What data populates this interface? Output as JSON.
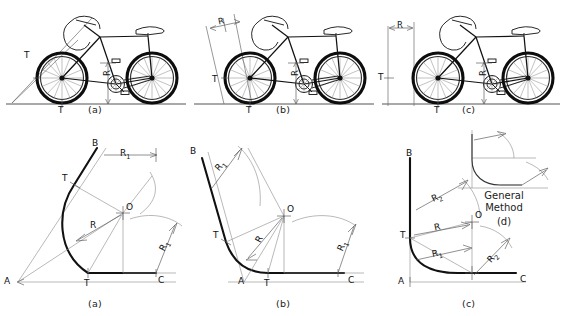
{
  "figure": {
    "background": "#ffffff",
    "ink": "#111111",
    "construction_color": "#8a8a8a"
  },
  "row1": {
    "panels": [
      {
        "caption": "(a)",
        "labels": [
          {
            "text": "T",
            "role": "tangent-point-left"
          },
          {
            "text": "T",
            "role": "tangent-point-ground"
          },
          {
            "text": "R",
            "role": "radius-vertical"
          }
        ]
      },
      {
        "caption": "(b)",
        "labels": [
          {
            "text": "R",
            "role": "radius-angled"
          },
          {
            "text": "T",
            "role": "tangent-point-left"
          },
          {
            "text": "T",
            "role": "tangent-point-ground"
          },
          {
            "text": "R",
            "role": "radius-vertical"
          }
        ]
      },
      {
        "caption": "(c)",
        "labels": [
          {
            "text": "R",
            "role": "radius-horizontal"
          },
          {
            "text": "T",
            "role": "tangent-point-left"
          },
          {
            "text": "T",
            "role": "tangent-point-ground"
          },
          {
            "text": "R",
            "role": "radius-vertical"
          }
        ]
      }
    ]
  },
  "row2": {
    "panels": [
      {
        "caption": "(a)",
        "labels": [
          {
            "text": "B",
            "role": "point-b"
          },
          {
            "text": "A",
            "role": "point-a"
          },
          {
            "text": "C",
            "role": "point-c"
          },
          {
            "text": "O",
            "role": "center-o"
          },
          {
            "text": "T",
            "role": "tangent-upper"
          },
          {
            "text": "T",
            "role": "tangent-lower"
          },
          {
            "text": "R",
            "role": "radius-main"
          },
          {
            "text": "R",
            "sub": "1",
            "role": "radius-one-top"
          },
          {
            "text": "R",
            "sub": "1",
            "role": "radius-one-right"
          }
        ]
      },
      {
        "caption": "(b)",
        "labels": [
          {
            "text": "B",
            "role": "point-b"
          },
          {
            "text": "A",
            "role": "point-a"
          },
          {
            "text": "C",
            "role": "point-c"
          },
          {
            "text": "O",
            "role": "center-o"
          },
          {
            "text": "T",
            "role": "tangent-upper"
          },
          {
            "text": "T",
            "role": "tangent-lower"
          },
          {
            "text": "R",
            "role": "radius-main"
          },
          {
            "text": "R",
            "sub": "1",
            "role": "radius-one-top"
          },
          {
            "text": "R",
            "sub": "1",
            "role": "radius-one-right"
          }
        ]
      },
      {
        "caption": "(c)",
        "labels": [
          {
            "text": "B",
            "role": "point-b"
          },
          {
            "text": "A",
            "role": "point-a"
          },
          {
            "text": "C",
            "role": "point-c"
          },
          {
            "text": "O",
            "role": "center-o"
          },
          {
            "text": "T",
            "role": "tangent-left"
          },
          {
            "text": "R",
            "sub": "2",
            "role": "radius-two-upper"
          },
          {
            "text": "R",
            "role": "radius-main"
          },
          {
            "text": "R",
            "sub": "1",
            "role": "radius-one-lower"
          },
          {
            "text": "R",
            "sub": "2",
            "role": "radius-two-right"
          }
        ]
      }
    ],
    "inset": {
      "title_line1": "General",
      "title_line2": "Method",
      "caption": "(d)"
    }
  }
}
